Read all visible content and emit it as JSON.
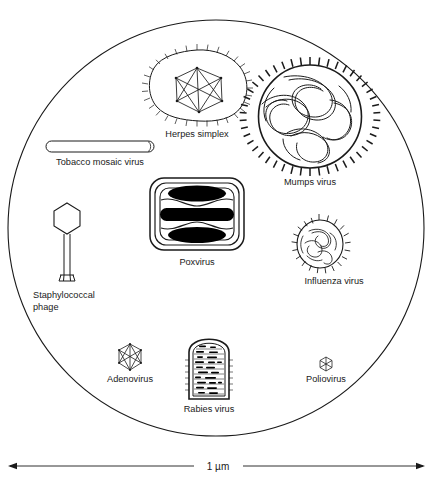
{
  "figure": {
    "title_hidden": "Relative sizes of viruses",
    "boundary": {
      "shape": "circle",
      "name": "field-of-view-circle"
    },
    "scale_bar": {
      "label": "1 µm",
      "left_arrow": "◀",
      "right_arrow": "▶"
    },
    "caption": "",
    "viruses": [
      {
        "id": "herpes-simplex",
        "label": "Herpes simplex",
        "shape": "enveloped-icosahedral",
        "cx": 197,
        "cy": 88,
        "label_x": 197,
        "label_y": 134
      },
      {
        "id": "tobacco-mosaic-virus",
        "label": "Tobacco mosaic virus",
        "shape": "rod",
        "cx": 100,
        "cy": 147,
        "label_x": 100,
        "label_y": 165
      },
      {
        "id": "mumps-virus",
        "label": "Mumps virus",
        "shape": "spiked-helical",
        "cx": 310,
        "cy": 115,
        "label_x": 310,
        "label_y": 183
      },
      {
        "id": "poxvirus",
        "label": "Poxvirus",
        "shape": "brick",
        "cx": 197,
        "cy": 215,
        "label_x": 197,
        "label_y": 264
      },
      {
        "id": "influenza-virus",
        "label": "Influenza virus",
        "shape": "spiked-helical",
        "cx": 319,
        "cy": 244,
        "label_x": 334,
        "label_y": 284
      },
      {
        "id": "staphylococcal-phage",
        "label": "Staphylococcal",
        "label2": "phage",
        "shape": "tailed-phage",
        "cx": 67,
        "cy": 245,
        "label_x": 33,
        "label_y": 297
      },
      {
        "id": "adenovirus",
        "label": "Adenovirus",
        "shape": "icosahedral",
        "cx": 130,
        "cy": 357,
        "label_x": 130,
        "label_y": 381
      },
      {
        "id": "rabies-virus",
        "label": "Rabies virus",
        "shape": "bullet",
        "cx": 209,
        "cy": 365,
        "label_x": 209,
        "label_y": 411
      },
      {
        "id": "poliovirus",
        "label": "Poliovirus",
        "shape": "icosahedral",
        "cx": 326,
        "cy": 364,
        "label_x": 326,
        "label_y": 381
      }
    ]
  },
  "colors": {
    "ink": "#1a1a1a",
    "fill": "#000000",
    "background": "#ffffff"
  }
}
